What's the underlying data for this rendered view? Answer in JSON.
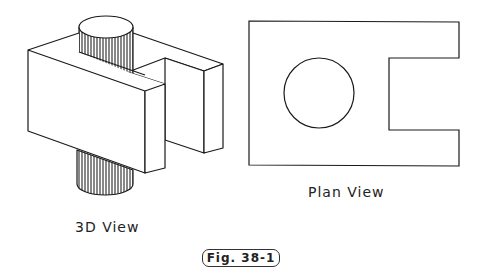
{
  "figure": {
    "label": "Fig. 38-1",
    "views": [
      {
        "id": "3d",
        "caption": "3D View"
      },
      {
        "id": "plan",
        "caption": "Plan View"
      }
    ]
  },
  "colors": {
    "line": "#1a1a1a",
    "background": "#ffffff"
  }
}
